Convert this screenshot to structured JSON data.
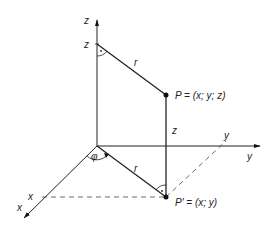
{
  "diagram": {
    "type": "cylindrical-coordinates",
    "axes": {
      "z_label": "z",
      "y_label": "y",
      "x_label": "x"
    },
    "labels": {
      "z_on_axis": "z",
      "y_on_axis": "y",
      "x_on_axis": "x",
      "r_top": "r",
      "r_bottom": "r",
      "z_height": "z",
      "phi": "φ",
      "point_P": "P = (x; y; z)",
      "point_P_prime": "P' = (x; y)"
    },
    "colors": {
      "line": "#222222",
      "background": "#ffffff"
    }
  }
}
